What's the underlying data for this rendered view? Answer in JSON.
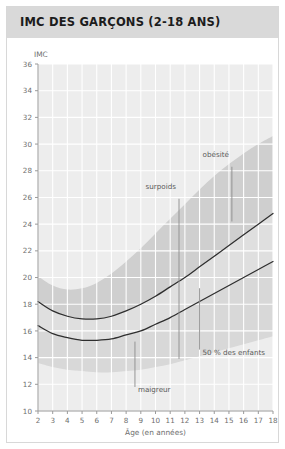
{
  "card": {
    "title": "IMC DES GARÇONS (2-18 ANS)"
  },
  "chart_data": {
    "type": "line",
    "title": "IMC DES GARÇONS (2-18 ANS)",
    "subtitle": "",
    "xlabel": "Âge (en années)",
    "ylabel": "IMC",
    "xlim": [
      2,
      18
    ],
    "ylim": [
      10,
      36
    ],
    "grid": true,
    "legend_position": "inline-annotations",
    "xticks": [
      2,
      3,
      4,
      5,
      6,
      7,
      8,
      9,
      10,
      11,
      12,
      13,
      14,
      15,
      16,
      17,
      18
    ],
    "yticks": [
      10,
      12,
      14,
      16,
      18,
      20,
      22,
      24,
      26,
      28,
      30,
      32,
      34,
      36
    ],
    "x": [
      2,
      3,
      4,
      5,
      6,
      7,
      8,
      9,
      10,
      11,
      12,
      13,
      14,
      15,
      16,
      17,
      18
    ],
    "series": [
      {
        "name": "surpoids",
        "label": "surpoids",
        "color": "#2e2e2e",
        "values": [
          18.2,
          17.5,
          17.1,
          16.9,
          16.9,
          17.1,
          17.5,
          18.0,
          18.6,
          19.3,
          20.0,
          20.8,
          21.6,
          22.4,
          23.2,
          24.0,
          24.8
        ]
      },
      {
        "name": "50 % des enfants",
        "label": "50 % des enfants",
        "color": "#2e2e2e",
        "values": [
          16.4,
          15.8,
          15.5,
          15.3,
          15.3,
          15.4,
          15.7,
          16.0,
          16.5,
          17.0,
          17.6,
          18.2,
          18.8,
          19.4,
          20.0,
          20.6,
          21.2
        ]
      }
    ],
    "bands": [
      {
        "name": "obesite",
        "label": "obésité",
        "color": "#c9c9c9",
        "lower": [
          18.2,
          17.5,
          17.1,
          16.9,
          16.9,
          17.1,
          17.5,
          18.0,
          18.6,
          19.3,
          20.0,
          20.8,
          21.6,
          22.4,
          23.2,
          24.0,
          24.8
        ],
        "upper": [
          20.1,
          19.4,
          19.1,
          19.2,
          19.6,
          20.3,
          21.2,
          22.2,
          23.3,
          24.4,
          25.5,
          26.6,
          27.6,
          28.5,
          29.3,
          30.0,
          30.6
        ]
      },
      {
        "name": "surpoids-band",
        "label": "surpoids",
        "color": "#dcdcdc",
        "lower": [
          16.4,
          15.8,
          15.5,
          15.3,
          15.3,
          15.4,
          15.7,
          16.0,
          16.5,
          17.0,
          17.6,
          18.2,
          18.8,
          19.4,
          20.0,
          20.6,
          21.2
        ],
        "upper": [
          18.2,
          17.5,
          17.1,
          16.9,
          16.9,
          17.1,
          17.5,
          18.0,
          18.6,
          19.3,
          20.0,
          20.8,
          21.6,
          22.4,
          23.2,
          24.0,
          24.8
        ]
      },
      {
        "name": "maigreur",
        "label": "maigreur",
        "color": "#d4d4d4",
        "lower": [
          13.6,
          13.3,
          13.1,
          13.0,
          12.9,
          12.9,
          13.0,
          13.1,
          13.3,
          13.5,
          13.8,
          14.1,
          14.4,
          14.7,
          15.0,
          15.3,
          15.6
        ],
        "upper": [
          16.4,
          15.8,
          15.5,
          15.3,
          15.3,
          15.4,
          15.7,
          16.0,
          16.5,
          17.0,
          17.6,
          18.2,
          18.8,
          19.4,
          20.0,
          20.6,
          21.2
        ]
      }
    ],
    "annotations": [
      {
        "name": "obesite",
        "text": "obésité",
        "x": 14.0,
        "y": 29.0
      },
      {
        "name": "surpoids",
        "text": "surpoids",
        "x": 10.4,
        "y": 26.6
      },
      {
        "name": "cinquante-pourcent",
        "text": "50 % des enfants",
        "x": 13.1,
        "y": 14.2
      },
      {
        "name": "maigreur",
        "text": "maigreur",
        "x": 8.5,
        "y": 11.4
      }
    ],
    "colors": {
      "curve": "#2e2e2e",
      "grid": "#ffffff",
      "axis": "#9a9a9a",
      "plot_background": "#ededed",
      "header_background": "#d9d9d9",
      "title_text": "#1c1c1c",
      "tick_text": "#6e6e6e"
    }
  }
}
